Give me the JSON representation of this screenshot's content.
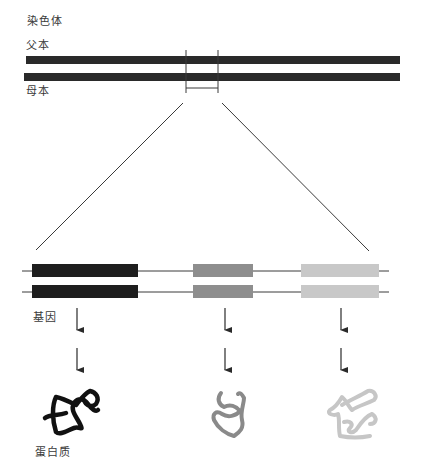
{
  "labels": {
    "chromosome": "染色体",
    "paternal": "父本",
    "maternal": "母本",
    "gene": "基因",
    "protein": "蛋白质"
  },
  "colors": {
    "chromosome": "#2a2a2a",
    "line": "#3a3a3a",
    "gene_1": "#1e1e1e",
    "gene_2": "#8e8e8e",
    "gene_3": "#c8c8c8",
    "protein_1": "#111111",
    "protein_2": "#8a8a8a",
    "protein_3": "#c6c6c6"
  },
  "genes": [
    {
      "shade": "black"
    },
    {
      "shade": "mid-gray"
    },
    {
      "shade": "light-gray"
    }
  ]
}
